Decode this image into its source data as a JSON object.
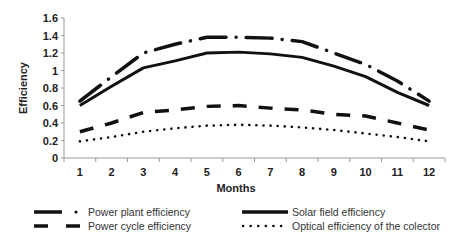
{
  "chart_data": {
    "type": "line",
    "title": "",
    "xlabel": "Months",
    "ylabel": "Efficiency",
    "x": [
      1,
      2,
      3,
      4,
      5,
      6,
      7,
      8,
      9,
      10,
      11,
      12
    ],
    "ylim": [
      0,
      1.6
    ],
    "yticks": [
      0,
      0.2,
      0.4,
      0.6,
      0.8,
      1,
      1.2,
      1.4,
      1.6
    ],
    "ytick_labels": [
      "0",
      "0.2",
      "0.4",
      "0.6",
      "0.8",
      "1",
      "1.2",
      "1.4",
      "1.6"
    ],
    "xtick_labels": [
      "1",
      "2",
      "3",
      "4",
      "5",
      "6",
      "7",
      "8",
      "9",
      "10",
      "11",
      "12"
    ],
    "grid": false,
    "legend_position": "bottom",
    "series": [
      {
        "name": "Power plant efficiency",
        "style": "dash-dot",
        "values": [
          0.65,
          0.93,
          1.2,
          1.3,
          1.38,
          1.38,
          1.37,
          1.33,
          1.2,
          1.07,
          0.88,
          0.65
        ]
      },
      {
        "name": "Solar field efficiency",
        "style": "solid",
        "values": [
          0.6,
          0.82,
          1.03,
          1.11,
          1.2,
          1.21,
          1.19,
          1.15,
          1.05,
          0.93,
          0.75,
          0.6
        ]
      },
      {
        "name": "Power cycle efficiency",
        "style": "dashed",
        "values": [
          0.3,
          0.4,
          0.52,
          0.55,
          0.59,
          0.6,
          0.57,
          0.55,
          0.5,
          0.48,
          0.4,
          0.32
        ]
      },
      {
        "name": "Optical efficiency of the colector",
        "style": "dotted",
        "values": [
          0.19,
          0.24,
          0.3,
          0.34,
          0.37,
          0.38,
          0.37,
          0.35,
          0.32,
          0.28,
          0.24,
          0.19
        ]
      }
    ]
  },
  "legend": {
    "items": [
      {
        "label": "Power plant efficiency"
      },
      {
        "label": "Solar field efficiency"
      },
      {
        "label": "Power cycle efficiency"
      },
      {
        "label": "Optical efficiency of the colector"
      }
    ]
  }
}
